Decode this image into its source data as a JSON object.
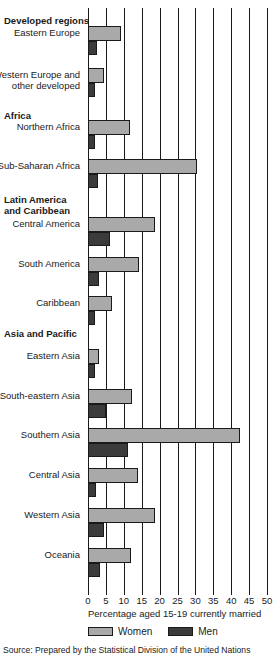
{
  "chart_data": {
    "type": "bar",
    "orientation": "horizontal",
    "title": "",
    "xlabel": "Percentage aged 15-19 currently married",
    "ylabel": "",
    "xlim": [
      0,
      50
    ],
    "xticks": [
      0,
      5,
      10,
      15,
      20,
      25,
      30,
      35,
      40,
      45,
      50
    ],
    "xtick_labels": [
      "0",
      "5",
      "10",
      "15",
      "20",
      "25",
      "30",
      "35",
      "40",
      "45",
      "50"
    ],
    "grid": true,
    "grid_axis": "x",
    "legend": [
      {
        "name": "Women",
        "color": "#a9a9a9"
      },
      {
        "name": "Men",
        "color": "#3b3b3b"
      }
    ],
    "legend_position": "bottom",
    "group_headers": [
      {
        "label": "Developed regions",
        "top": 7
      },
      {
        "label": "Africa",
        "top": 102
      },
      {
        "label": "Latin America",
        "top": 186
      },
      {
        "label": "and Caribbean",
        "top": 197
      },
      {
        "label": "Asia and Pacific",
        "top": 320
      }
    ],
    "categories": [
      "Eastern Europe",
      "Western Europe and other developed",
      "Northern Africa",
      "Sub-Saharan Africa",
      "Central America",
      "South America",
      "Caribbean",
      "Eastern Asia",
      "South-eastern Asia",
      "Southern Asia",
      "Central Asia",
      "Western Asia",
      "Oceania"
    ],
    "series": [
      {
        "name": "Women",
        "color": "#a9a9a9",
        "values": [
          9.2,
          4.5,
          11.7,
          30.4,
          18.7,
          14.2,
          6.7,
          3.1,
          12.3,
          42.5,
          14.0,
          18.7,
          12.0
        ]
      },
      {
        "name": "Men",
        "color": "#3b3b3b",
        "values": [
          2.4,
          2.0,
          2.0,
          2.8,
          6.1,
          3.1,
          2.0,
          2.0,
          5.0,
          11.2,
          2.2,
          4.5,
          3.4
        ]
      }
    ],
    "rows": [
      {
        "label": "Eastern Europe",
        "label_line2": "",
        "top": 18,
        "women": 9.2,
        "men": 2.4
      },
      {
        "label": "Western Europe and",
        "label_line2": "other developed",
        "top": 60,
        "women": 4.5,
        "men": 2.0
      },
      {
        "label": "Northern Africa",
        "label_line2": "",
        "top": 112,
        "women": 11.7,
        "men": 2.0
      },
      {
        "label": "Sub-Saharan Africa",
        "label_line2": "",
        "top": 151,
        "women": 30.4,
        "men": 2.8
      },
      {
        "label": "Central America",
        "top": 209,
        "label_line2": "",
        "women": 18.7,
        "men": 6.1
      },
      {
        "label": "South America",
        "label_line2": "",
        "top": 249,
        "women": 14.2,
        "men": 3.1
      },
      {
        "label": "Caribbean",
        "label_line2": "",
        "top": 288,
        "women": 6.7,
        "men": 2.0
      },
      {
        "label": "Eastern Asia",
        "label_line2": "",
        "top": 341,
        "women": 3.1,
        "men": 2.0
      },
      {
        "label": "South-eastern Asia",
        "label_line2": "",
        "top": 381,
        "women": 12.3,
        "men": 5.0
      },
      {
        "label": "Southern Asia",
        "label_line2": "",
        "top": 420,
        "women": 42.5,
        "men": 11.2
      },
      {
        "label": "Central Asia",
        "label_line2": "",
        "top": 460,
        "women": 14.0,
        "men": 2.2
      },
      {
        "label": "Western Asia",
        "label_line2": "",
        "top": 500,
        "women": 18.7,
        "men": 4.5
      },
      {
        "label": "Oceania",
        "label_line2": "",
        "top": 540,
        "women": 12.0,
        "men": 3.4
      }
    ]
  },
  "source": {
    "text": "Source: Prepared by the Statistical Division of the United Nations"
  },
  "colors": {
    "women": "#a9a9a9",
    "men": "#3b3b3b",
    "axis": "#1a1a1a",
    "background": "#ffffff"
  }
}
